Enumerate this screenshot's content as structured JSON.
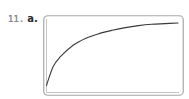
{
  "exercise": {
    "number": "11.",
    "part": "a."
  },
  "colors": {
    "frame": "#9a9a9a",
    "frame_inner": "#c8c8c8",
    "curve": "#3a3a3a",
    "number_text": "#8a8a8a",
    "part_text": "#2a2a2a"
  },
  "chart_data": {
    "type": "line",
    "title": "",
    "xlabel": "",
    "ylabel": "",
    "grid": false,
    "legend": null,
    "x": [
      0,
      5,
      10,
      20,
      30,
      40,
      50,
      60,
      70,
      80,
      90,
      100
    ],
    "series": [
      {
        "name": "curve",
        "values": [
          0,
          28,
          42,
          60,
          71,
          78,
          83,
          87,
          90,
          92,
          93,
          94
        ]
      }
    ],
    "xlim": [
      0,
      100
    ],
    "ylim": [
      -10,
      100
    ]
  }
}
